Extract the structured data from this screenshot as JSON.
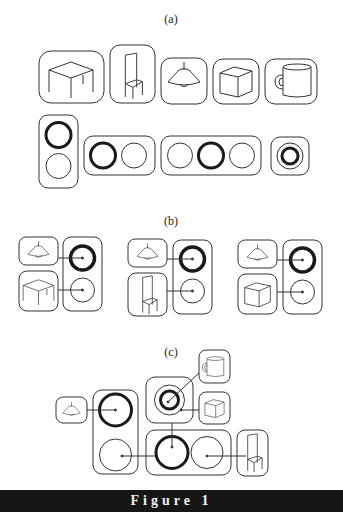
{
  "figure": {
    "caption": "Figure 1",
    "panels": [
      {
        "label": "(a)",
        "description": "Objects and circle groupings",
        "objects": [
          "table-icon",
          "chair-icon",
          "lamp-icon",
          "cube-icon",
          "mug-icon"
        ],
        "circle_groups": [
          {
            "layout": "vertical",
            "circles": [
              "bold",
              "thin"
            ]
          },
          {
            "layout": "horizontal",
            "circles": [
              "bold",
              "thin"
            ]
          },
          {
            "layout": "horizontal",
            "circles": [
              "thin",
              "bold",
              "thin"
            ]
          },
          {
            "layout": "nested",
            "circles": [
              "thin-outer",
              "bold-inner"
            ]
          }
        ]
      },
      {
        "label": "(b)",
        "description": "Lamp paired with another object, linked to vertical circle group",
        "groups": [
          {
            "top": "lamp-icon",
            "bottom": "table-icon"
          },
          {
            "top": "lamp-icon",
            "bottom": "chair-icon"
          },
          {
            "top": "lamp-icon",
            "bottom": "cube-icon"
          }
        ]
      },
      {
        "label": "(c)",
        "description": "Composite hierarchical arrangement",
        "objects": [
          "lamp-icon",
          "mug-icon",
          "cube-icon",
          "chair-icon"
        ]
      }
    ]
  },
  "colors": {
    "stroke": "#333333",
    "bold_stroke": "#1a1a1a",
    "footer_bg": "#161616",
    "footer_text": "#f0f0f0"
  }
}
